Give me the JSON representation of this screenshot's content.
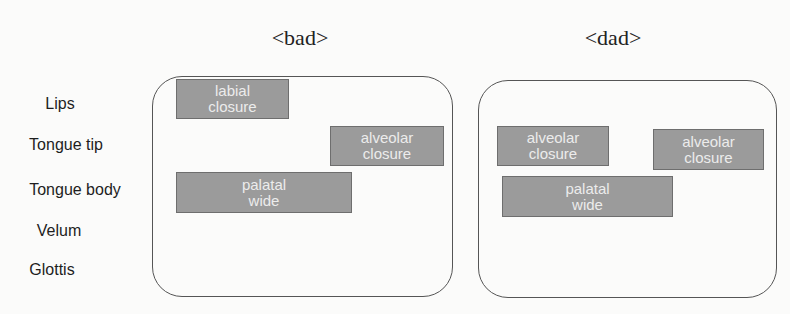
{
  "titles": {
    "left": "<bad>",
    "right": "<dad>"
  },
  "row_labels": [
    "Lips",
    "Tongue tip",
    "Tongue body",
    "Velum",
    "Glottis"
  ],
  "panels": {
    "bad": {
      "word": "<bad>",
      "gestures": [
        {
          "tier": "Lips",
          "line1": "labial",
          "line2": "closure"
        },
        {
          "tier": "Tongue tip",
          "line1": "alveolar",
          "line2": "closure"
        },
        {
          "tier": "Tongue body",
          "line1": "palatal",
          "line2": "wide"
        }
      ]
    },
    "dad": {
      "word": "<dad>",
      "gestures": [
        {
          "tier": "Tongue tip",
          "line1": "alveolar",
          "line2": "closure"
        },
        {
          "tier": "Tongue tip",
          "line1": "alveolar",
          "line2": "closure"
        },
        {
          "tier": "Tongue body",
          "line1": "palatal",
          "line2": "wide"
        }
      ]
    }
  },
  "colors": {
    "gesture_fill": "#9b9b9b",
    "gesture_border": "#6e6e6e",
    "gesture_text": "#ececec",
    "panel_border": "#555555"
  }
}
